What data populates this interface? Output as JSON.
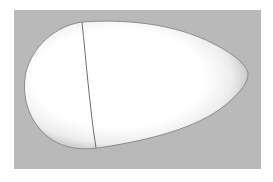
{
  "image": {
    "subject": "3D rendered egg-shaped surface",
    "background_color": "#b9b9b9",
    "margin_color": "#ffffff",
    "object_fill_color": "#ffffff",
    "object_shade_color": "#9a9a9a",
    "seam_line_color": "#6e6e6e"
  }
}
